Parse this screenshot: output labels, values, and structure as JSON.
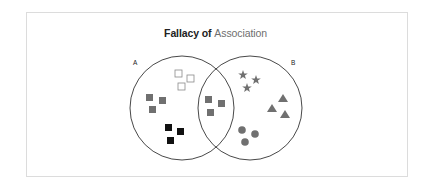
{
  "title": {
    "part1": "Fallacy of ",
    "part2": "Association"
  },
  "sets": [
    {
      "label": "A",
      "cx": 182,
      "cy": 108,
      "r": 52
    },
    {
      "label": "B",
      "cx": 250,
      "cy": 108,
      "r": 52
    }
  ],
  "colors": {
    "circle_stroke": "#333333",
    "gray_fill": "#707070",
    "black_fill": "#111111",
    "outline_stroke": "#8a8a8a",
    "frame_border": "#dcdcdc"
  },
  "groups": [
    {
      "name": "outline-squares",
      "region": "A only",
      "shape": "square-outline",
      "count": 3
    },
    {
      "name": "gray-squares-a",
      "region": "A only",
      "shape": "square-gray",
      "count": 3
    },
    {
      "name": "black-squares",
      "region": "A only",
      "shape": "square-black",
      "count": 3
    },
    {
      "name": "gray-squares-overlap",
      "region": "A and B",
      "shape": "square-gray",
      "count": 3
    },
    {
      "name": "stars",
      "region": "B only",
      "shape": "star-gray",
      "count": 3
    },
    {
      "name": "triangles",
      "region": "B only",
      "shape": "triangle-gray",
      "count": 3
    },
    {
      "name": "circles",
      "region": "B only",
      "shape": "dot-gray",
      "count": 3
    }
  ]
}
